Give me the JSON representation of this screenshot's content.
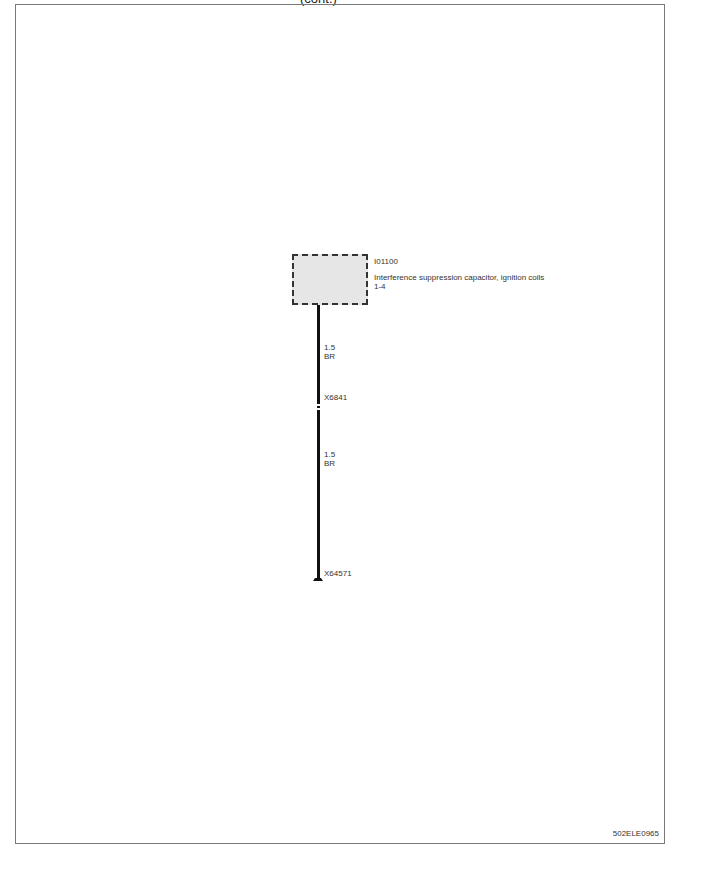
{
  "header": {
    "title": "(cont.)"
  },
  "component": {
    "id": "I01100",
    "description_line1": "Interference suppression capacitor, ignition coils",
    "description_line2": "1-4"
  },
  "wires": [
    {
      "size": "1.5",
      "color": "BR"
    },
    {
      "size": "1.5",
      "color": "BR"
    }
  ],
  "connectors": [
    {
      "id": "X6841"
    },
    {
      "id": "X64571"
    }
  ],
  "footer": {
    "reference": "502ELE0965"
  }
}
